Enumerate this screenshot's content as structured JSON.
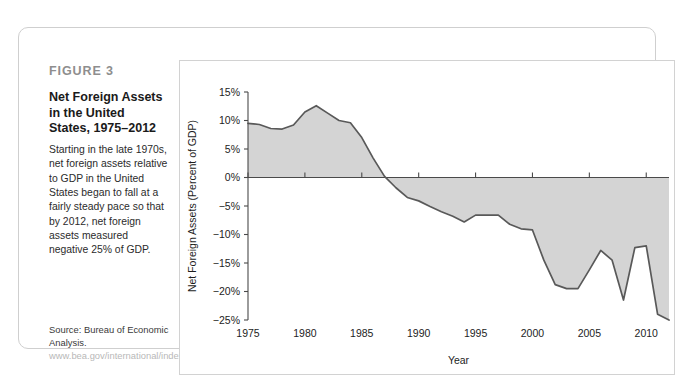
{
  "figure": {
    "label": "FIGURE 3",
    "title": "Net Foreign Assets in the United States, 1975–2012",
    "description": "Starting in the late 1970s, net foreign assets relative to GDP in the United States began to fall at a fairly steady pace so that by 2012, net foreign assets measured negative 25% of GDP.",
    "source_prefix": "Source: Bureau of Economic Analysis.",
    "source_url": "www.bea.gov/international/index.htm/iip"
  },
  "chart_data": {
    "type": "area",
    "title": "Net Foreign Assets in the United States, 1975–2012",
    "xlabel": "Year",
    "ylabel": "Net Foreign Assets (Percent of GDP)",
    "xlim": [
      1975,
      2012
    ],
    "ylim": [
      -25,
      15
    ],
    "grid": false,
    "legend": "none",
    "x_ticks": [
      1975,
      1980,
      1985,
      1990,
      1995,
      2000,
      2005,
      2010
    ],
    "x_tick_labels": [
      "1975",
      "1980",
      "1985",
      "1990",
      "1995",
      "2000",
      "2005",
      "2010"
    ],
    "y_ticks": [
      15,
      10,
      5,
      0,
      -5,
      -10,
      -15,
      -20,
      -25
    ],
    "y_tick_labels": [
      "15%",
      "10%",
      "5%",
      "0%",
      "−5%",
      "−10%",
      "−15%",
      "−20%",
      "−25%"
    ],
    "series": [
      {
        "name": "Net Foreign Assets (Percent of GDP)",
        "x": [
          1975,
          1976,
          1977,
          1978,
          1979,
          1980,
          1981,
          1982,
          1983,
          1984,
          1985,
          1986,
          1987,
          1988,
          1989,
          1990,
          1991,
          1992,
          1993,
          1994,
          1995,
          1996,
          1997,
          1998,
          1999,
          2000,
          2001,
          2002,
          2003,
          2004,
          2005,
          2006,
          2007,
          2008,
          2009,
          2010,
          2011,
          2012
        ],
        "values": [
          9.5,
          9.3,
          8.6,
          8.5,
          9.2,
          11.5,
          12.6,
          11.3,
          10.0,
          9.6,
          7.0,
          3.4,
          0.2,
          -1.8,
          -3.5,
          -4.1,
          -5.1,
          -6.0,
          -6.8,
          -7.8,
          -6.6,
          -6.6,
          -6.6,
          -8.2,
          -9.0,
          -9.2,
          -14.5,
          -18.8,
          -19.5,
          -19.5,
          -16.2,
          -12.8,
          -14.5,
          -21.5,
          -12.3,
          -12.0,
          -24.0,
          -25.0
        ]
      }
    ]
  },
  "colors": {
    "area_fill": "#d4d4d4",
    "line": "#595959",
    "axis": "#4a4a4a",
    "panel_border": "#d2d2d2",
    "card_border": "#cfcfcf",
    "figure_label": "#8e8e8e",
    "url_text": "#b8b8b8"
  }
}
